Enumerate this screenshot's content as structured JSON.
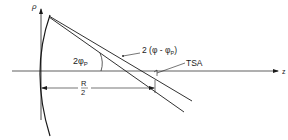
{
  "diagram": {
    "axes": {
      "vertical_label": "ρ",
      "horizontal_label": "z"
    },
    "labels": {
      "angle_inner": "2φ",
      "angle_inner_sub": "P",
      "angle_outer_prefix": "2 (φ - φ",
      "angle_outer_sub": "P",
      "angle_outer_suffix": ")",
      "tsa": "TSA",
      "dimension_num": "R",
      "dimension_den": "2"
    },
    "colors": {
      "ink": "#1a1a1a",
      "background": "#ffffff"
    }
  }
}
